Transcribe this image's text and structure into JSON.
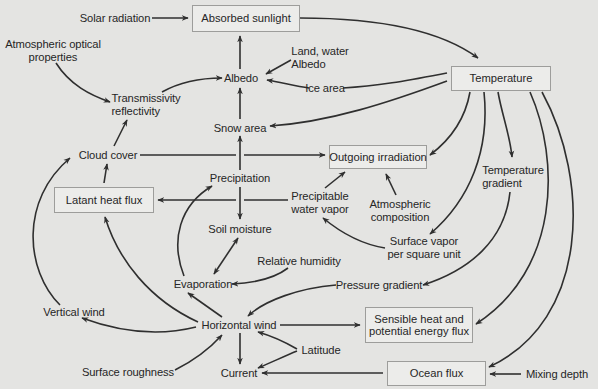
{
  "diagram": {
    "boxed_nodes": {
      "absorbed_sunlight": "Absorbed sunlight",
      "temperature": "Temperature",
      "outgoing_irradiation": "Outgoing irradiation",
      "latant_heat_flux": "Latant heat flux",
      "sensible_heat_line1": "Sensible heat and",
      "sensible_heat_line2": "potential energy flux",
      "ocean_flux": "Ocean flux"
    },
    "nodes": {
      "solar_radiation": "Solar radiation",
      "atmospheric_optical_line1": "Atmospheric optical",
      "atmospheric_optical_line2": "properties",
      "land_water_line1": "Land, water",
      "land_water_line2": "Albedo",
      "albedo": "Albedo",
      "ice_area": "Ice area",
      "transmissivity_line1": "Transmissivity",
      "transmissivity_line2": "reflectivity",
      "snow_area": "Snow area",
      "cloud_cover": "Cloud cover",
      "precipitation": "Precipitation",
      "precipitable_line1": "Precipitable",
      "precipitable_line2": "water vapor",
      "temperature_gradient_line1": "Temperature",
      "temperature_gradient_line2": "gradient",
      "atmospheric_composition_line1": "Atmospheric",
      "atmospheric_composition_line2": "composition",
      "soil_moisture": "Soil moisture",
      "surface_vapor_line1": "Surface vapor",
      "surface_vapor_line2": "per square unit",
      "relative_humidity": "Relative humidity",
      "evaporation": "Evaporation",
      "pressure_gradient": "Pressure gradient",
      "vertical_wind": "Vertical wind",
      "horizontal_wind": "Horizontal wind",
      "latitude": "Latitude",
      "surface_roughness": "Surface roughness",
      "current": "Current",
      "mixing_depth": "Mixing depth"
    },
    "edges": [
      [
        "Solar radiation",
        "Absorbed sunlight"
      ],
      [
        "Absorbed sunlight",
        "Temperature"
      ],
      [
        "Albedo",
        "Absorbed sunlight"
      ],
      [
        "Land, water Albedo",
        "Albedo"
      ],
      [
        "Ice area",
        "Albedo"
      ],
      [
        "Temperature",
        "Ice area"
      ],
      [
        "Temperature",
        "Snow area"
      ],
      [
        "Snow area",
        "Albedo"
      ],
      [
        "Transmissivity reflectivity",
        "Albedo"
      ],
      [
        "Atmospheric optical properties",
        "Transmissivity reflectivity"
      ],
      [
        "Cloud cover",
        "Transmissivity reflectivity"
      ],
      [
        "Cloud cover",
        "Outgoing irradiation"
      ],
      [
        "Temperature",
        "Outgoing irradiation"
      ],
      [
        "Precipitation",
        "Snow area"
      ],
      [
        "Precipitation",
        "Soil moisture"
      ],
      [
        "Precipitable water vapor",
        "Latant heat flux"
      ],
      [
        "Precipitable water vapor",
        "Outgoing irradiation"
      ],
      [
        "Atmospheric composition",
        "Outgoing irradiation"
      ],
      [
        "Latant heat flux",
        "Cloud cover"
      ],
      [
        "Temperature",
        "Temperature gradient"
      ],
      [
        "Temperature",
        "Surface vapor per square unit"
      ],
      [
        "Surface vapor per square unit",
        "Precipitable water vapor"
      ],
      [
        "Temperature gradient",
        "Pressure gradient"
      ],
      [
        "Evaporation",
        "Precipitation"
      ],
      [
        "Soil moisture",
        "Evaporation"
      ],
      [
        "Evaporation",
        "Soil moisture"
      ],
      [
        "Relative humidity",
        "Evaporation"
      ],
      [
        "Pressure gradient",
        "Horizontal wind"
      ],
      [
        "Horizontal wind",
        "Evaporation"
      ],
      [
        "Horizontal wind",
        "Latant heat flux"
      ],
      [
        "Horizontal wind",
        "Vertical wind"
      ],
      [
        "Vertical wind",
        "Cloud cover"
      ],
      [
        "Horizontal wind",
        "Sensible heat and potential energy flux"
      ],
      [
        "Horizontal wind",
        "Current"
      ],
      [
        "Latitude",
        "Horizontal wind"
      ],
      [
        "Latitude",
        "Current"
      ],
      [
        "Surface roughness",
        "Horizontal wind"
      ],
      [
        "Ocean flux",
        "Current"
      ],
      [
        "Temperature",
        "Sensible heat and potential energy flux"
      ],
      [
        "Temperature",
        "Ocean flux"
      ],
      [
        "Mixing depth",
        "Ocean flux"
      ]
    ]
  }
}
